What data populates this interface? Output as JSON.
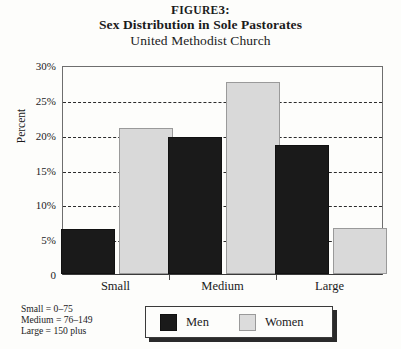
{
  "title": {
    "figure_label_prefix": "F",
    "figure_label": "IGURE",
    "figure_number": "3:",
    "line1": "Sex Distribution in Sole Pastorates",
    "line2": "United Methodist Church"
  },
  "chart_data": {
    "type": "bar",
    "title": "Sex Distribution in Sole Pastorates",
    "subtitle": "United Methodist Church",
    "figure_label": "FIGURE 3:",
    "categories": [
      "Small",
      "Medium",
      "Large"
    ],
    "series": [
      {
        "name": "Men",
        "values": [
          6.4,
          19.6,
          18.5
        ],
        "color": "#1a1a1a"
      },
      {
        "name": "Women",
        "values": [
          21.0,
          27.5,
          6.6
        ],
        "color": "#d9d9d9"
      }
    ],
    "xlabel": "",
    "ylabel": "Percent",
    "ylim": [
      0,
      30
    ],
    "yticks": [
      0,
      5,
      10,
      15,
      20,
      25,
      30
    ],
    "ytick_labels": [
      "0",
      "5%",
      "10%",
      "15%",
      "20%",
      "25%",
      "30%"
    ],
    "grid": true,
    "gridlines_at": [
      5,
      10,
      15,
      20,
      25
    ],
    "legend_position": "bottom-center"
  },
  "axis": {
    "y_label": "Percent",
    "y_ticks": [
      {
        "value": 30,
        "label": "30%"
      },
      {
        "value": 25,
        "label": "25%"
      },
      {
        "value": 20,
        "label": "20%"
      },
      {
        "value": 15,
        "label": "15%"
      },
      {
        "value": 10,
        "label": "10%"
      },
      {
        "value": 5,
        "label": "5%"
      },
      {
        "value": 0,
        "label": "0"
      }
    ],
    "x_categories": [
      "Small",
      "Medium",
      "Large"
    ]
  },
  "legend": {
    "items": [
      {
        "label": "Men",
        "color": "#1a1a1a"
      },
      {
        "label": "Women",
        "color": "#d9d9d9"
      }
    ]
  },
  "footnote": {
    "lines": [
      "Small = 0–75",
      "Medium = 76–149",
      "Large = 150 plus"
    ]
  }
}
